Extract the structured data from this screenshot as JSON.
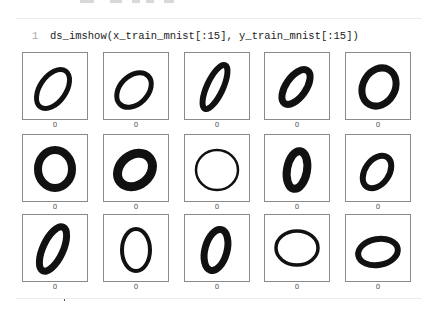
{
  "notebook": {
    "cell": {
      "line_number": "1",
      "code": "ds_imshow(x_train_mnist[:15], y_train_mnist[:15])"
    },
    "output": {
      "images": [
        {
          "label": "0",
          "rx": 13,
          "ry": 22,
          "rot": 35,
          "sw": 5,
          "cx": 30,
          "cy": 36
        },
        {
          "label": "0",
          "rx": 14,
          "ry": 20,
          "rot": 45,
          "sw": 5,
          "cx": 30,
          "cy": 37
        },
        {
          "label": "0",
          "rx": 8,
          "ry": 24,
          "rot": 25,
          "sw": 6,
          "cx": 30,
          "cy": 34
        },
        {
          "label": "0",
          "rx": 10,
          "ry": 20,
          "rot": 35,
          "sw": 7,
          "cx": 31,
          "cy": 34
        },
        {
          "label": "0",
          "rx": 16,
          "ry": 20,
          "rot": 30,
          "sw": 7,
          "cx": 33,
          "cy": 34
        },
        {
          "label": "0",
          "rx": 17,
          "ry": 19,
          "rot": 0,
          "sw": 8,
          "cx": 32,
          "cy": 34
        },
        {
          "label": "0",
          "rx": 15,
          "ry": 19,
          "rot": 50,
          "sw": 9,
          "cx": 31,
          "cy": 35
        },
        {
          "label": "0",
          "rx": 21,
          "ry": 20,
          "rot": 0,
          "sw": 2.5,
          "cx": 32,
          "cy": 35
        },
        {
          "label": "0",
          "rx": 10,
          "ry": 19,
          "rot": 10,
          "sw": 8,
          "cx": 32,
          "cy": 35
        },
        {
          "label": "0",
          "rx": 12,
          "ry": 18,
          "rot": 35,
          "sw": 6,
          "cx": 31,
          "cy": 37
        },
        {
          "label": "0",
          "rx": 10,
          "ry": 24,
          "rot": 25,
          "sw": 7,
          "cx": 30,
          "cy": 34
        },
        {
          "label": "0",
          "rx": 14,
          "ry": 21,
          "rot": 0,
          "sw": 4,
          "cx": 32,
          "cy": 35
        },
        {
          "label": "0",
          "rx": 11,
          "ry": 21,
          "rot": 15,
          "sw": 7,
          "cx": 31,
          "cy": 35
        },
        {
          "label": "0",
          "rx": 21,
          "ry": 17,
          "rot": 0,
          "sw": 3.5,
          "cx": 32,
          "cy": 33
        },
        {
          "label": "0",
          "rx": 20,
          "ry": 13,
          "rot": -10,
          "sw": 6,
          "cx": 32,
          "cy": 37
        }
      ]
    }
  }
}
